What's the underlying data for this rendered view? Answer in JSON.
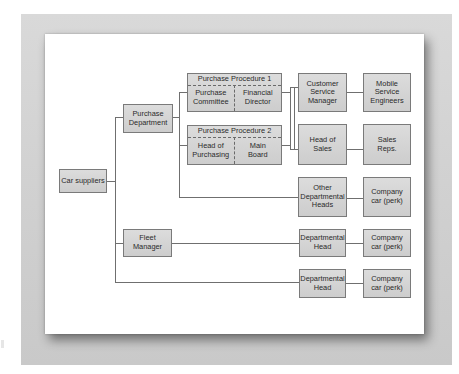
{
  "diagram": {
    "type": "organization-flow",
    "root": {
      "label": "Car suppliers"
    },
    "level1": [
      {
        "label": "Purchase\nDepartment"
      },
      {
        "label": "Fleet\nManager"
      }
    ],
    "procedures": [
      {
        "title": "Purchase Procedure 1",
        "left": "Purchase\nCommittee",
        "right": "Financial\nDirector"
      },
      {
        "title": "Purchase Procedure 2",
        "left": "Head of\nPurchasing",
        "right": "Main\nBoard"
      }
    ],
    "roles": [
      {
        "label": "Customer\nService\nManager",
        "target": "Mobile\nService\nEngineers"
      },
      {
        "label": "Head of\nSales",
        "target": "Sales\nReps."
      },
      {
        "label": "Other\nDepartmental\nHeads",
        "target": "Company\ncar (perk)"
      },
      {
        "label": "Departmental\nHead",
        "target": "Company\ncar (perk)"
      },
      {
        "label": "Departmental\nHead",
        "target": "Company\ncar (perk)"
      }
    ],
    "colors": {
      "box_fill": "#d4d4d4",
      "box_border": "#7a7a7a",
      "line": "#6f6f6f",
      "frame": "#d0d0d0",
      "card": "#ffffff"
    }
  }
}
